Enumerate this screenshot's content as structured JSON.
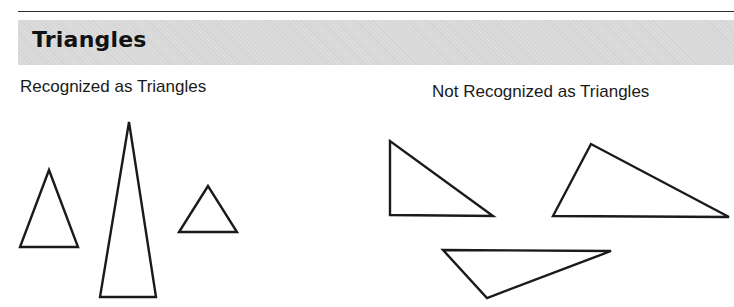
{
  "header": {
    "title": "Triangles"
  },
  "groups": [
    {
      "label": "Recognized as Triangles",
      "shapes": [
        {
          "name": "acute-triangle-small",
          "points": "49,170 20,247 78,247"
        },
        {
          "name": "tall-isosceles-triangle",
          "points": "129,122 100,297 156,297"
        },
        {
          "name": "equilateral-triangle-small",
          "points": "208,186 179,232 237,232"
        }
      ]
    },
    {
      "label": "Not Recognized as Triangles",
      "shapes": [
        {
          "name": "right-triangle",
          "points": "390,141 390,215 493,216"
        },
        {
          "name": "obtuse-triangle-wide",
          "points": "591,144 553,216 729,217"
        },
        {
          "name": "inverted-obtuse-triangle",
          "points": "443,250 611,251 487,298"
        }
      ]
    }
  ],
  "colors": {
    "stroke": "#1a1a1a",
    "header_band": "#dcdcdc"
  }
}
